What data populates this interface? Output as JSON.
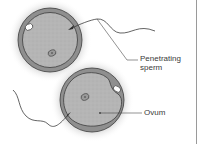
{
  "diagram": {
    "labels": {
      "penetrating_sperm_line1": "Penetrating",
      "penetrating_sperm_line2": "sperm",
      "ovum": "Ovum"
    },
    "colors": {
      "cytoplasm": "#b3b3b3",
      "zona": "#8c8c8c",
      "outline": "#3c3c3c",
      "halo": "#cfcfcf",
      "line": "#4a4a4a",
      "text": "#3a3a3a"
    }
  }
}
